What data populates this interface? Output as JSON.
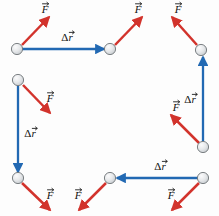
{
  "figure": {
    "name": "force-displacement-vector-diagram",
    "background_color": "#fdfdfd",
    "width": 219,
    "height": 216,
    "colors": {
      "force_arrow": "#d2332c",
      "displacement_arrow": "#2269b3",
      "ball_fill": "#e4e6e8",
      "ball_edge": "#6e7477",
      "label_text": "#111111"
    },
    "labels": {
      "force": "F",
      "displacement_delta": "Δ",
      "displacement_r": "r",
      "vector_accent": "→"
    }
  },
  "balls": [
    {
      "id": "ball-top-left",
      "cx": 17,
      "cy": 49
    },
    {
      "id": "ball-top-mid",
      "cx": 110,
      "cy": 49
    },
    {
      "id": "ball-top-right",
      "cx": 201,
      "cy": 50
    },
    {
      "id": "ball-mid-left",
      "cx": 18,
      "cy": 80
    },
    {
      "id": "ball-bottom-left",
      "cx": 18,
      "cy": 178
    },
    {
      "id": "ball-bottom-mid",
      "cx": 110,
      "cy": 178
    },
    {
      "id": "ball-bottom-right",
      "cx": 203,
      "cy": 178
    },
    {
      "id": "ball-mid-right",
      "cx": 203,
      "cy": 147
    }
  ],
  "displacement_arrows": [
    {
      "id": "disp-top",
      "x1": 22,
      "y1": 49,
      "x2": 104,
      "y2": 49,
      "label_x": 67,
      "label_y": 38
    },
    {
      "id": "disp-left",
      "x1": 18,
      "y1": 86,
      "x2": 18,
      "y2": 172,
      "label_x": 30,
      "label_y": 134
    },
    {
      "id": "disp-bottom",
      "x1": 198,
      "y1": 178,
      "x2": 117,
      "y2": 178,
      "label_x": 160,
      "label_y": 167
    },
    {
      "id": "disp-right",
      "x1": 203,
      "y1": 141,
      "x2": 203,
      "y2": 57,
      "label_x": 190,
      "label_y": 100
    }
  ],
  "force_arrows": [
    {
      "id": "force-top-left",
      "x1": 22,
      "y1": 45,
      "x2": 49,
      "y2": 17,
      "label_x": 45,
      "label_y": 10
    },
    {
      "id": "force-top-mid",
      "x1": 115,
      "y1": 45,
      "x2": 142,
      "y2": 17,
      "label_x": 138,
      "label_y": 10
    },
    {
      "id": "force-top-right",
      "x1": 197,
      "y1": 45,
      "x2": 172,
      "y2": 17,
      "label_x": 178,
      "label_y": 10
    },
    {
      "id": "force-mid-left",
      "x1": 23,
      "y1": 85,
      "x2": 50,
      "y2": 113,
      "label_x": 50,
      "label_y": 99
    },
    {
      "id": "force-mid-right",
      "x1": 199,
      "y1": 143,
      "x2": 171,
      "y2": 115,
      "label_x": 176,
      "label_y": 108
    },
    {
      "id": "force-bottom-left",
      "x1": 22,
      "y1": 183,
      "x2": 50,
      "y2": 210,
      "label_x": 50,
      "label_y": 196
    },
    {
      "id": "force-bottom-mid",
      "x1": 106,
      "y1": 183,
      "x2": 79,
      "y2": 210,
      "label_x": 78,
      "label_y": 196
    },
    {
      "id": "force-bottom-right",
      "x1": 199,
      "y1": 183,
      "x2": 172,
      "y2": 210,
      "label_x": 171,
      "label_y": 196
    }
  ]
}
